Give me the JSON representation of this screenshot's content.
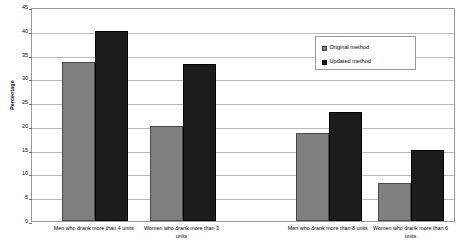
{
  "chart_data": {
    "type": "bar",
    "title": "",
    "xlabel": "",
    "ylabel": "Percentage",
    "ylim": [
      0,
      45
    ],
    "ytick_step": 5,
    "yticks": [
      0,
      5,
      10,
      15,
      20,
      25,
      30,
      35,
      40,
      45
    ],
    "grid": true,
    "legend_position": "upper right",
    "categories": [
      "Men who drank more than 4 units",
      "Women who drank more than 3 units",
      "Men who drank more than 8 units",
      "Women who drank more than 6 units"
    ],
    "series": [
      {
        "name": "Original method",
        "color": "#808080",
        "values": [
          33.5,
          20,
          18.5,
          8
        ]
      },
      {
        "name": "Updated method",
        "color": "#1c1c1c",
        "values": [
          40,
          33,
          23,
          15
        ]
      }
    ]
  },
  "legend": {
    "entries": [
      {
        "label": "Original method"
      },
      {
        "label": "Updated method"
      }
    ]
  },
  "axis": {
    "y_title": "Percentage"
  }
}
